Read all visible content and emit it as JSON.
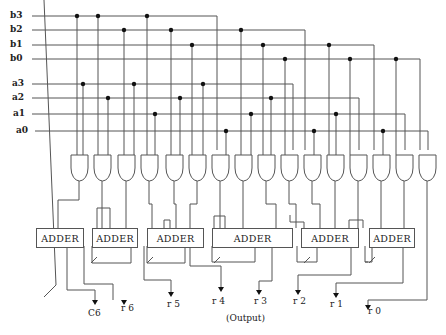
{
  "diagram": {
    "inputs": {
      "b": [
        "b3",
        "b2",
        "b1",
        "b0"
      ],
      "a": [
        "a3",
        "a2",
        "a1",
        "a0"
      ]
    },
    "gates": {
      "count": 16,
      "type": "AND"
    },
    "adders": [
      {
        "label": "ADDER"
      },
      {
        "label": "ADDER"
      },
      {
        "label": "ADDER"
      },
      {
        "label": "ADDER"
      },
      {
        "label": "ADDER"
      },
      {
        "label": "ADDER"
      }
    ],
    "outputs": [
      "C6",
      "r 6",
      "r 5",
      "r 4",
      "r 3",
      "r 2",
      "r 1",
      "r 0"
    ],
    "output_caption": "(Output)",
    "colors": {
      "line": "#555555",
      "dot": "#111111",
      "background": "#ffffff"
    }
  }
}
